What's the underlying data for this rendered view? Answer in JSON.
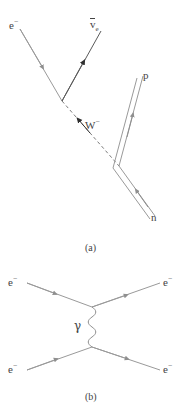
{
  "figure": {
    "type": "feynman-diagrams",
    "panels": [
      {
        "id": "a",
        "caption": "(a)",
        "process": "inverse-beta-decay",
        "labels": {
          "electron": "e",
          "electron_charge": "−",
          "antineutrino": "v",
          "antineutrino_sub": "e",
          "w_boson": "W",
          "w_boson_charge": "−",
          "proton": "p",
          "neutron": "n"
        }
      },
      {
        "id": "b",
        "caption": "(b)",
        "process": "electron-electron-scattering",
        "labels": {
          "electron_in_top": "e",
          "electron_in_top_charge": "−",
          "electron_in_bottom": "e",
          "electron_in_bottom_charge": "−",
          "electron_out_top": "e",
          "electron_out_top_charge": "−",
          "electron_out_bottom": "e",
          "electron_out_bottom_charge": "−",
          "photon": "γ"
        }
      }
    ],
    "colors": {
      "line": "#9a9a9a",
      "line_dark": "#4a4a4a",
      "text": "#444444",
      "background": "#ffffff"
    }
  }
}
